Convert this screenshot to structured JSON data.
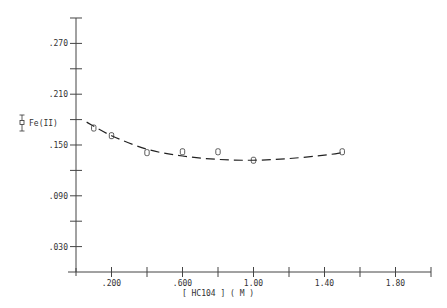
{
  "chart_data": {
    "type": "scatter",
    "title": "",
    "xlabel": "[ HC104 ] ( M )",
    "ylabel": "",
    "xlim": [
      0.0,
      2.0
    ],
    "ylim": [
      0.0,
      0.3
    ],
    "x_ticks": [
      0.2,
      0.4,
      0.6,
      0.8,
      1.0,
      1.2,
      1.4,
      1.6,
      1.8,
      2.0
    ],
    "x_tick_labels": [
      {
        "value": 0.2,
        "label": ".200"
      },
      {
        "value": 0.6,
        "label": ".600"
      },
      {
        "value": 1.0,
        "label": "1.00"
      },
      {
        "value": 1.4,
        "label": "1.40"
      },
      {
        "value": 1.8,
        "label": "1.80"
      }
    ],
    "y_ticks": [
      0.03,
      0.06,
      0.09,
      0.12,
      0.15,
      0.18,
      0.21,
      0.24,
      0.27,
      0.3
    ],
    "y_tick_labels": [
      {
        "value": 0.03,
        "label": ".030"
      },
      {
        "value": 0.09,
        "label": ".090"
      },
      {
        "value": 0.15,
        "label": ".150"
      },
      {
        "value": 0.21,
        "label": ".210"
      },
      {
        "value": 0.27,
        "label": ".270"
      }
    ],
    "grid": false,
    "legend": {
      "position": "left",
      "entries": [
        "Fe(II)"
      ]
    },
    "series": [
      {
        "name": "Fe(II)",
        "type": "scatter",
        "marker": "square-with-errorbar",
        "x": [
          0.1,
          0.2,
          0.4,
          0.6,
          0.8,
          1.0,
          1.5
        ],
        "y": [
          0.17,
          0.161,
          0.141,
          0.142,
          0.142,
          0.132,
          0.142
        ]
      },
      {
        "name": "fit",
        "type": "line",
        "style": "dashed",
        "x": [
          0.06,
          0.2,
          0.4,
          0.6,
          0.8,
          1.0,
          1.2,
          1.4,
          1.5
        ],
        "y": [
          0.177,
          0.161,
          0.145,
          0.137,
          0.133,
          0.132,
          0.134,
          0.138,
          0.141
        ]
      }
    ]
  }
}
